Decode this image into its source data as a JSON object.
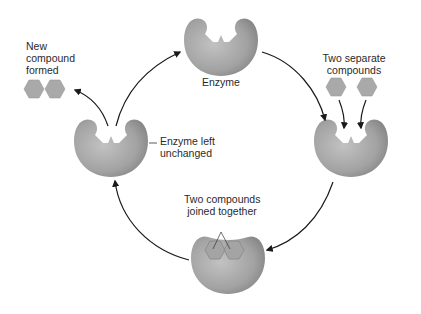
{
  "diagram": {
    "colors": {
      "enzyme_light": "#b4b4b4",
      "enzyme_dark": "#8a8a8a",
      "compound_fill": "#a9a9a9",
      "compound_stroke": "#8c8c8c",
      "arrow": "#1a1a1a",
      "background": "#ffffff"
    },
    "labels": {
      "enzyme": "Enzyme",
      "two_separate_line1": "Two separate",
      "two_separate_line2": "compounds",
      "joined_line1": "Two compounds",
      "joined_line2": "joined together",
      "left_unchanged_line1": "Enzyme left",
      "left_unchanged_line2": "unchanged",
      "new_compound_line1": "New",
      "new_compound_line2": "compound",
      "new_compound_line3": "formed"
    },
    "nodes": [
      {
        "id": "enzyme-top",
        "label": "Enzyme"
      },
      {
        "id": "enzyme-right",
        "label": "Two separate compounds"
      },
      {
        "id": "enzyme-bottom",
        "label": "Two compounds joined together"
      },
      {
        "id": "enzyme-left",
        "label": "Enzyme left unchanged"
      },
      {
        "id": "product",
        "label": "New compound formed"
      }
    ],
    "edges": [
      {
        "from": "enzyme-top",
        "to": "enzyme-right"
      },
      {
        "from": "enzyme-right",
        "to": "enzyme-bottom"
      },
      {
        "from": "enzyme-bottom",
        "to": "enzyme-left"
      },
      {
        "from": "enzyme-left",
        "to": "enzyme-top"
      },
      {
        "from": "enzyme-left",
        "to": "product"
      }
    ]
  }
}
